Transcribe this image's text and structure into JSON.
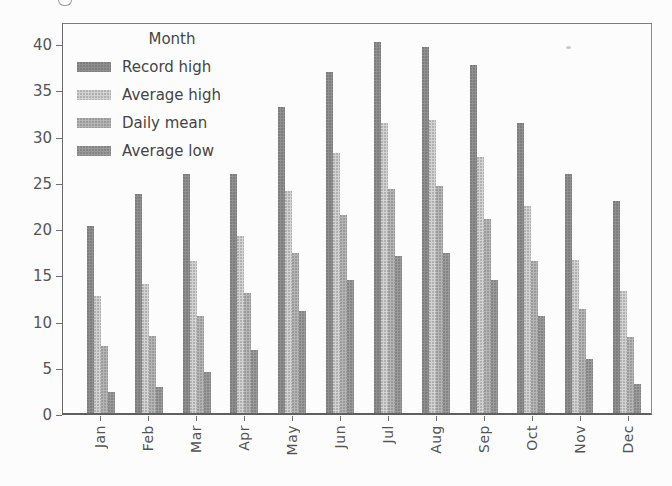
{
  "figure": {
    "background": "#fcfcfc",
    "axis_color": "#6f6f6f",
    "text_color": "#4f4f4f"
  },
  "legend": {
    "title": "Month",
    "entries": [
      {
        "label": "Record high",
        "color": "#8f8f8f",
        "icon": "swatch-dark-gray"
      },
      {
        "label": "Average high",
        "color": "#d2d2d2",
        "icon": "swatch-light-gray"
      },
      {
        "label": "Daily mean",
        "color": "#b5b5b5",
        "icon": "swatch-medium-gray"
      },
      {
        "label": "Average low",
        "color": "#9a9a9a",
        "icon": "swatch-gray"
      }
    ]
  },
  "chart_data": {
    "type": "bar",
    "title": "",
    "xlabel": "",
    "ylabel": "",
    "categories": [
      "Jan",
      "Feb",
      "Mar",
      "Apr",
      "May",
      "Jun",
      "Jul",
      "Aug",
      "Sep",
      "Oct",
      "Nov",
      "Dec"
    ],
    "series": [
      {
        "name": "Record high",
        "color": "#8f8f8f",
        "values": [
          20.2,
          23.7,
          25.9,
          25.9,
          33.1,
          36.9,
          40.1,
          39.6,
          37.6,
          31.4,
          25.9,
          22.9
        ]
      },
      {
        "name": "Average high",
        "color": "#d2d2d2",
        "values": [
          12.7,
          14.0,
          16.4,
          19.1,
          24.0,
          28.1,
          31.4,
          31.7,
          27.7,
          22.4,
          16.5,
          13.2
        ]
      },
      {
        "name": "Daily mean",
        "color": "#b5b5b5",
        "values": [
          7.3,
          8.3,
          10.5,
          13.0,
          17.3,
          21.4,
          24.2,
          24.6,
          21.0,
          16.4,
          11.3,
          8.2
        ]
      },
      {
        "name": "Average low",
        "color": "#9a9a9a",
        "values": [
          2.3,
          2.8,
          4.4,
          6.8,
          11.0,
          14.4,
          17.0,
          17.3,
          14.4,
          10.5,
          5.8,
          3.1
        ]
      }
    ],
    "ylim": [
      0,
      42.4
    ],
    "yticks": [
      0,
      5,
      10,
      15,
      20,
      25,
      30,
      35,
      40
    ],
    "grid": false,
    "legend_title": "Month",
    "legend_position": "upper left",
    "xtick_rotation": 90
  }
}
